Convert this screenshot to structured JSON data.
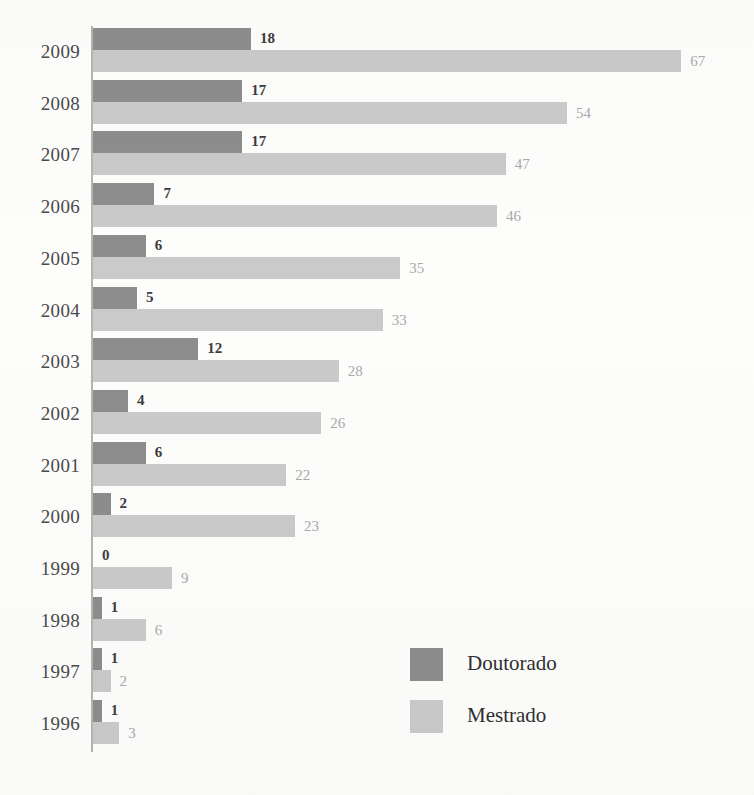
{
  "chart_data": {
    "type": "bar",
    "orientation": "horizontal",
    "title": "",
    "xlabel": "",
    "ylabel": "",
    "grid": false,
    "legend_position": "inside-bottom-right",
    "categories": [
      "2009",
      "2008",
      "2007",
      "2006",
      "2005",
      "2004",
      "2003",
      "2002",
      "2001",
      "2000",
      "1999",
      "1998",
      "1997",
      "1996"
    ],
    "series": [
      {
        "name": "Doutorado",
        "color": "#8d8d8d",
        "values": [
          18,
          17,
          17,
          7,
          6,
          5,
          12,
          4,
          6,
          2,
          0,
          1,
          1,
          1
        ]
      },
      {
        "name": "Mestrado",
        "color": "#cacaca",
        "values": [
          67,
          54,
          47,
          46,
          35,
          33,
          28,
          26,
          22,
          23,
          9,
          6,
          2,
          3
        ]
      }
    ],
    "xlim": [
      0,
      67
    ],
    "value_labels_shown": true
  },
  "legend": {
    "items": [
      {
        "label": "Doutorado",
        "color": "#8d8d8d"
      },
      {
        "label": "Mestrado",
        "color": "#cacaca"
      }
    ]
  },
  "axis": {
    "line_color": "#b4b4b2"
  }
}
